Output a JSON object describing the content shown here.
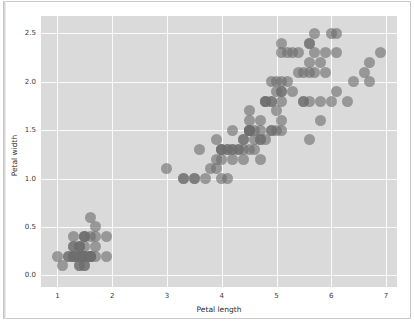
{
  "figure": {
    "background_color": "#ffffff",
    "plot_background_color": "#dadada",
    "grid_color": "#fbfbfb",
    "marker_color": "#6e6e6e"
  },
  "chart_data": {
    "type": "scatter",
    "title": "",
    "xlabel": "Petal length",
    "ylabel": "Petal width",
    "xlim": [
      0.7,
      7.2
    ],
    "ylim": [
      -0.12,
      2.68
    ],
    "xticks": [
      1,
      2,
      3,
      4,
      5,
      6,
      7
    ],
    "xticklabels": [
      "1",
      "2",
      "3",
      "4",
      "5",
      "6",
      "7"
    ],
    "yticks": [
      0.0,
      0.5,
      1.0,
      1.5,
      2.0,
      2.5
    ],
    "yticklabels": [
      "0.0",
      "0.5",
      "1.0",
      "1.5",
      "2.0",
      "2.5"
    ],
    "grid": true,
    "legend": null,
    "marker": "circle",
    "marker_alpha": 0.62,
    "marker_size": 11,
    "series": [
      {
        "name": "iris petals",
        "x": [
          1.4,
          1.4,
          1.3,
          1.5,
          1.4,
          1.7,
          1.4,
          1.5,
          1.4,
          1.5,
          1.5,
          1.6,
          1.4,
          1.1,
          1.2,
          1.5,
          1.3,
          1.4,
          1.7,
          1.5,
          1.7,
          1.5,
          1.0,
          1.7,
          1.9,
          1.6,
          1.6,
          1.5,
          1.4,
          1.6,
          1.6,
          1.5,
          1.5,
          1.4,
          1.5,
          1.2,
          1.3,
          1.4,
          1.3,
          1.5,
          1.3,
          1.3,
          1.3,
          1.6,
          1.9,
          1.4,
          1.6,
          1.4,
          1.5,
          1.4,
          4.7,
          4.5,
          4.9,
          4.0,
          4.6,
          4.5,
          4.7,
          3.3,
          4.6,
          3.9,
          3.5,
          4.2,
          4.0,
          4.7,
          3.6,
          4.4,
          4.5,
          4.1,
          4.5,
          3.9,
          4.8,
          4.0,
          4.9,
          4.7,
          4.3,
          4.4,
          4.8,
          5.0,
          4.5,
          3.5,
          3.8,
          3.7,
          3.9,
          5.1,
          4.5,
          4.5,
          4.7,
          4.4,
          4.1,
          4.0,
          4.4,
          4.6,
          4.0,
          3.3,
          4.2,
          4.2,
          4.2,
          4.3,
          3.0,
          4.1,
          6.0,
          5.1,
          5.9,
          5.6,
          5.8,
          6.6,
          4.5,
          6.3,
          5.8,
          6.1,
          5.1,
          5.3,
          5.5,
          5.0,
          5.1,
          5.3,
          5.5,
          6.7,
          6.9,
          5.0,
          5.7,
          4.9,
          6.7,
          4.9,
          5.7,
          6.0,
          4.8,
          4.9,
          5.6,
          5.8,
          6.1,
          6.4,
          5.6,
          5.1,
          5.6,
          6.1,
          5.6,
          5.5,
          4.8,
          5.4,
          5.6,
          5.1,
          5.1,
          5.9,
          5.7,
          5.2,
          5.0,
          5.2,
          5.4,
          5.1
        ],
        "y": [
          0.2,
          0.2,
          0.2,
          0.2,
          0.2,
          0.4,
          0.3,
          0.2,
          0.2,
          0.1,
          0.2,
          0.2,
          0.1,
          0.1,
          0.2,
          0.4,
          0.4,
          0.3,
          0.3,
          0.3,
          0.2,
          0.4,
          0.2,
          0.5,
          0.2,
          0.2,
          0.4,
          0.2,
          0.2,
          0.2,
          0.2,
          0.4,
          0.1,
          0.2,
          0.2,
          0.2,
          0.2,
          0.1,
          0.2,
          0.2,
          0.3,
          0.3,
          0.2,
          0.6,
          0.4,
          0.3,
          0.2,
          0.2,
          0.2,
          0.2,
          1.4,
          1.5,
          1.5,
          1.3,
          1.5,
          1.3,
          1.6,
          1.0,
          1.3,
          1.4,
          1.0,
          1.5,
          1.0,
          1.4,
          1.3,
          1.4,
          1.5,
          1.0,
          1.5,
          1.1,
          1.8,
          1.3,
          1.5,
          1.2,
          1.3,
          1.4,
          1.4,
          1.7,
          1.5,
          1.0,
          1.1,
          1.0,
          1.2,
          1.6,
          1.5,
          1.6,
          1.5,
          1.3,
          1.3,
          1.3,
          1.2,
          1.4,
          1.2,
          1.0,
          1.3,
          1.2,
          1.3,
          1.3,
          1.1,
          1.3,
          2.5,
          1.9,
          2.1,
          1.8,
          2.2,
          2.1,
          1.7,
          1.8,
          1.8,
          2.5,
          2.0,
          1.9,
          2.1,
          2.0,
          2.4,
          2.3,
          1.8,
          2.2,
          2.3,
          1.5,
          2.3,
          2.0,
          2.0,
          1.8,
          2.1,
          1.8,
          1.8,
          1.8,
          2.1,
          1.6,
          1.9,
          2.0,
          2.2,
          1.5,
          1.4,
          2.3,
          2.4,
          1.8,
          1.8,
          2.1,
          2.4,
          2.3,
          1.9,
          2.3,
          2.5,
          2.3,
          1.9,
          2.0,
          2.3,
          1.8
        ]
      }
    ]
  }
}
